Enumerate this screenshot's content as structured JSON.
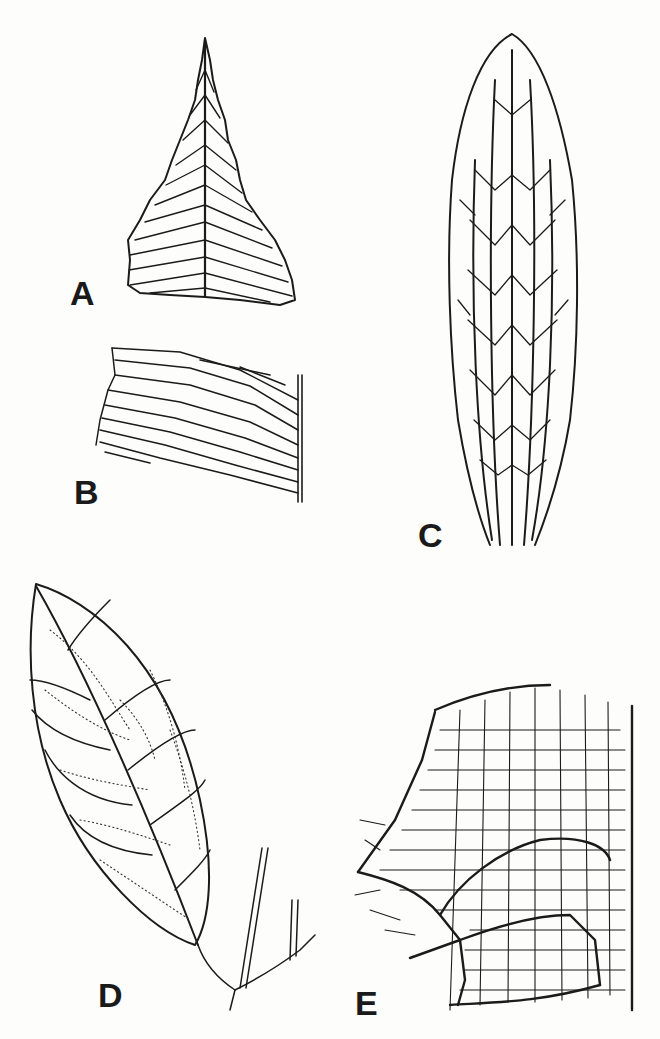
{
  "figure": {
    "panels": [
      {
        "id": "A",
        "label": "A",
        "description": "triangular leaf apex with pinnate secondary veins"
      },
      {
        "id": "B",
        "label": "B",
        "description": "leaf fragment with parallel oblique veins meeting a midrib"
      },
      {
        "id": "C",
        "label": "C",
        "description": "elongate leaf with parallel primary veins and reticulate cross-veins"
      },
      {
        "id": "D",
        "label": "D",
        "description": "elliptic leaf on twig with pinnate venation and dotted fine reticulation"
      },
      {
        "id": "E",
        "label": "E",
        "description": "detail of reticulate areolate venation near leaf margin"
      }
    ]
  }
}
